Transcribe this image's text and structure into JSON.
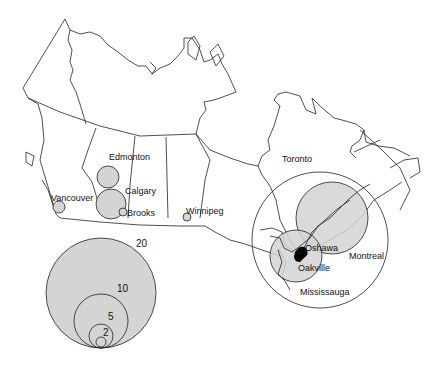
{
  "map": {
    "title": "Canada proportional circle map",
    "colors": {
      "circle_fill": "#d4d4d4",
      "outline": "#222222",
      "background": "#ffffff",
      "core": "#000000"
    }
  },
  "cities": [
    {
      "name": "Edmonton",
      "label": "Edmonton"
    },
    {
      "name": "Calgary",
      "label": "Calgary"
    },
    {
      "name": "Vancouver",
      "label": "Vancouver"
    },
    {
      "name": "Brooks",
      "label": "Brooks"
    },
    {
      "name": "Winnipeg",
      "label": "Winnipeg"
    },
    {
      "name": "Toronto",
      "label": "Toronto"
    },
    {
      "name": "Oshawa",
      "label": "Oshawa"
    },
    {
      "name": "Oakville",
      "label": "Oakville"
    },
    {
      "name": "Montreal",
      "label": "Montreal"
    },
    {
      "name": "Mississauga",
      "label": "Mississauga"
    }
  ],
  "legend": {
    "values": [
      "20",
      "10",
      "5",
      "2"
    ]
  }
}
